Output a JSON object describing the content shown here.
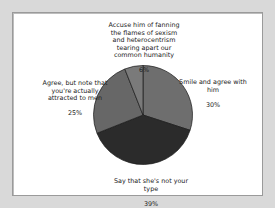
{
  "chart_data": {
    "type": "pie",
    "title": "",
    "categories": [
      "Smile and agree with him",
      "Say that she's not your type",
      "Agree, but note that you're actually attracted to men",
      "Accuse him of fanning the flames of sexism and heterocentrism tearing apart our common humanity"
    ],
    "values": [
      30,
      39,
      25,
      6
    ],
    "unit": "%",
    "start_angle": "12 o'clock",
    "direction": "clockwise",
    "colors": [
      "#6e6e6e",
      "#2b2b2b",
      "#676767",
      "#7a7a7a"
    ],
    "legend": "none (direct labels)"
  },
  "labels": {
    "accuse": {
      "text": "Accuse him of fanning\nthe flames of sexism\nand heterocentrism\ntearing apart our\ncommon humanity",
      "pct": "6%"
    },
    "smile": {
      "text": "Smile and agree with\nhim",
      "pct": "30%"
    },
    "agree": {
      "text": "Agree, but note that\nyou're actually\nattracted to men",
      "pct": "25%"
    },
    "say": {
      "text": "Say that she's not your\ntype",
      "pct": "39%"
    }
  }
}
